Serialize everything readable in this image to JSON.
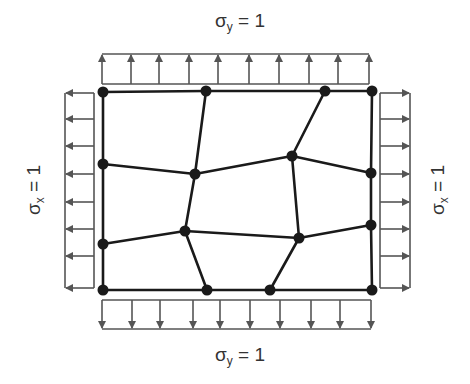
{
  "labels": {
    "top": {
      "sym": "σ",
      "sub": "y",
      "rest": " = 1"
    },
    "bottom": {
      "sym": "σ",
      "sub": "y",
      "rest": " = 1"
    },
    "left": {
      "sym": "σ",
      "sub": "x",
      "rest": " = 1"
    },
    "right": {
      "sym": "σ",
      "sub": "x",
      "rest": " = 1"
    }
  },
  "colors": {
    "mesh": "#1a1a1a",
    "arrows": "#555555",
    "text": "#333333"
  },
  "mesh": {
    "nodes": [
      [
        103,
        92
      ],
      [
        206,
        91
      ],
      [
        325,
        91
      ],
      [
        372,
        91
      ],
      [
        103,
        164
      ],
      [
        195,
        174
      ],
      [
        292,
        156
      ],
      [
        371,
        173
      ],
      [
        103,
        244
      ],
      [
        185,
        231
      ],
      [
        299,
        238
      ],
      [
        371,
        225
      ],
      [
        103,
        290
      ],
      [
        207,
        290
      ],
      [
        270,
        290
      ],
      [
        372,
        290
      ]
    ],
    "edges": [
      [
        0,
        1
      ],
      [
        1,
        2
      ],
      [
        2,
        3
      ],
      [
        3,
        7
      ],
      [
        7,
        11
      ],
      [
        11,
        15
      ],
      [
        12,
        13
      ],
      [
        13,
        14
      ],
      [
        14,
        15
      ],
      [
        0,
        4
      ],
      [
        4,
        8
      ],
      [
        8,
        12
      ],
      [
        1,
        5
      ],
      [
        2,
        6
      ],
      [
        4,
        5
      ],
      [
        5,
        6
      ],
      [
        6,
        7
      ],
      [
        5,
        9
      ],
      [
        6,
        10
      ],
      [
        8,
        9
      ],
      [
        9,
        10
      ],
      [
        10,
        11
      ],
      [
        9,
        13
      ],
      [
        10,
        14
      ]
    ]
  },
  "loads": {
    "top_arrows_x": [
      102,
      131,
      159,
      189,
      218,
      249,
      279,
      309,
      338,
      369
    ],
    "bottom_arrows_x": [
      102,
      132,
      160,
      193,
      220,
      250,
      280,
      311,
      340,
      371
    ],
    "left_arrows_y": [
      93,
      119,
      146,
      174,
      202,
      229,
      256,
      288
    ],
    "right_arrows_y": [
      93,
      119,
      146,
      174,
      202,
      229,
      256,
      288
    ]
  }
}
